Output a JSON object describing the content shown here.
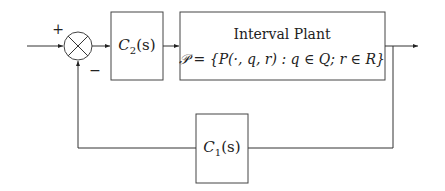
{
  "diagram": {
    "type": "feedback-control-block-diagram",
    "summing_junction": {
      "plus_sign": "+",
      "minus_sign": "−"
    },
    "blocks": {
      "c2": {
        "name": "C",
        "subscript": "2",
        "arg": "(s)"
      },
      "plant": {
        "title": "Interval Plant",
        "set_definition": "𝒫 = {P(·, q, r) :  q ∈ Q;  r ∈ R}"
      },
      "c1": {
        "name": "C",
        "subscript": "1",
        "arg": "(s)"
      }
    },
    "edges": [
      {
        "from": "input",
        "to": "summing_junction",
        "sign": "+"
      },
      {
        "from": "summing_junction",
        "to": "c2"
      },
      {
        "from": "c2",
        "to": "plant"
      },
      {
        "from": "plant",
        "to": "output"
      },
      {
        "from": "plant",
        "to": "c1",
        "kind": "feedback-tap"
      },
      {
        "from": "c1",
        "to": "summing_junction",
        "sign": "−"
      }
    ]
  }
}
